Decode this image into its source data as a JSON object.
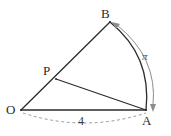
{
  "figure": {
    "type": "circular-sector-geometry-diagram",
    "background_color": "#ffffff",
    "stroke_color": "#2b2b2b",
    "accent_color": "#8c8c8c",
    "dashed_color": "#9a9a9a",
    "labels": {
      "center_point": "O",
      "arc_start_point": "A",
      "arc_end_point": "B",
      "interior_point": "P",
      "arc_length": "π",
      "radius_measure": "4"
    },
    "points": {
      "O": {
        "x": 21,
        "y": 110
      },
      "A": {
        "x": 146,
        "y": 110
      },
      "B": {
        "x": 110,
        "y": 22
      },
      "P": {
        "x": 56,
        "y": 79
      }
    },
    "segments": [
      {
        "name": "segment-OB",
        "from": "O",
        "to": "B"
      },
      {
        "name": "segment-OA",
        "from": "O",
        "to": "A"
      },
      {
        "name": "segment-PA",
        "from": "P",
        "to": "A"
      }
    ],
    "arcs": [
      {
        "name": "arc-BA",
        "from": "B",
        "to": "A",
        "style": "solid"
      },
      {
        "name": "arc-length-indicator",
        "from": "B",
        "to": "A",
        "style": "double-arrow",
        "measure": "π"
      },
      {
        "name": "radius-brace",
        "from": "O",
        "to": "A",
        "style": "dashed",
        "measure": "4"
      }
    ]
  }
}
